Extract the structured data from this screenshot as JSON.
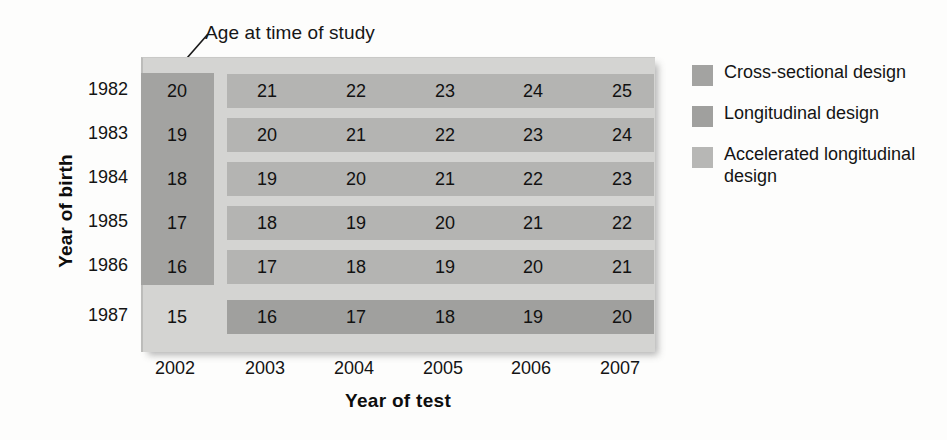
{
  "annotation": {
    "label": "Age at time of study",
    "leader_icon": "leader-line-icon"
  },
  "axes": {
    "y_title": "Year of birth",
    "x_title": "Year of test",
    "y_ticks": [
      "1982",
      "1983",
      "1984",
      "1985",
      "1986",
      "1987"
    ],
    "x_ticks": [
      "2002",
      "2003",
      "2004",
      "2005",
      "2006",
      "2007"
    ]
  },
  "legend": {
    "entries": [
      {
        "label": "Cross-sectional design",
        "color": "#a3a3a1",
        "swatch_name": "cross-sectional-swatch"
      },
      {
        "label": "Longitudinal design",
        "color": "#a0a09e",
        "swatch_name": "longitudinal-swatch"
      },
      {
        "label": "Accelerated longitudinal design",
        "color": "#b7b7b5",
        "swatch_name": "accelerated-longitudinal-swatch"
      }
    ]
  },
  "colors": {
    "panel_background": "#d4d4d2",
    "cross_sectional": "#a3a3a1",
    "longitudinal": "#a0a09e",
    "accelerated": "#b4b4b2",
    "text": "#111111"
  },
  "chart_data": {
    "type": "table",
    "title": "Age at time of study",
    "xlabel": "Year of test",
    "ylabel": "Year of birth",
    "categories": [
      "2002",
      "2003",
      "2004",
      "2005",
      "2006",
      "2007"
    ],
    "rows": [
      {
        "year_of_birth": "1982",
        "ages": [
          "20",
          "21",
          "22",
          "23",
          "24",
          "25"
        ]
      },
      {
        "year_of_birth": "1983",
        "ages": [
          "19",
          "20",
          "21",
          "22",
          "23",
          "24"
        ]
      },
      {
        "year_of_birth": "1984",
        "ages": [
          "18",
          "19",
          "20",
          "21",
          "22",
          "23"
        ]
      },
      {
        "year_of_birth": "1985",
        "ages": [
          "17",
          "18",
          "19",
          "20",
          "21",
          "22"
        ]
      },
      {
        "year_of_birth": "1986",
        "ages": [
          "16",
          "17",
          "18",
          "19",
          "20",
          "21"
        ]
      },
      {
        "year_of_birth": "1987",
        "ages": [
          "15",
          "16",
          "17",
          "18",
          "19",
          "20"
        ]
      }
    ],
    "highlights": {
      "cross_sectional": {
        "column": "2002",
        "rows": [
          "1982",
          "1983",
          "1984",
          "1985",
          "1986"
        ],
        "values": [
          "20",
          "19",
          "18",
          "17",
          "16"
        ]
      },
      "longitudinal": {
        "row": "1987",
        "columns": [
          "2003",
          "2004",
          "2005",
          "2006",
          "2007"
        ],
        "values": [
          "16",
          "17",
          "18",
          "19",
          "20"
        ]
      },
      "accelerated_longitudinal": {
        "rows": [
          "1982",
          "1983",
          "1984",
          "1985",
          "1986"
        ],
        "columns": [
          "2003",
          "2004",
          "2005",
          "2006",
          "2007"
        ]
      }
    },
    "legend": [
      "Cross-sectional design",
      "Longitudinal design",
      "Accelerated longitudinal design"
    ],
    "legend_position": "right",
    "grid": false
  }
}
